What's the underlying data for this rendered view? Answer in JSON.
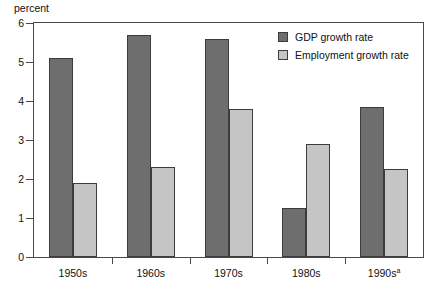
{
  "chart_data": {
    "type": "bar",
    "title": "",
    "xlabel": "",
    "ylabel": "percent",
    "ylim": [
      0,
      6
    ],
    "ytick_labels": [
      "0",
      "1",
      "2",
      "3",
      "4",
      "5",
      "6"
    ],
    "yticks": [
      0,
      1,
      2,
      3,
      4,
      5,
      6
    ],
    "grid": false,
    "legend_position": "top-right inside plot",
    "categories": [
      "1950s",
      "1960s",
      "1970s",
      "1980s",
      "1990s"
    ],
    "category_labels": [
      {
        "text": "1950s",
        "superscript": ""
      },
      {
        "text": "1960s",
        "superscript": ""
      },
      {
        "text": "1970s",
        "superscript": ""
      },
      {
        "text": "1980s",
        "superscript": ""
      },
      {
        "text": "1990s",
        "superscript": "a"
      }
    ],
    "series": [
      {
        "name": "GDP growth rate",
        "color": "#6e6e6e",
        "values": [
          5.1,
          5.7,
          5.6,
          1.25,
          3.85
        ]
      },
      {
        "name": "Employment growth rate",
        "color": "#c5c5c5",
        "values": [
          1.9,
          2.3,
          3.8,
          2.9,
          2.25
        ]
      }
    ]
  },
  "legend": {
    "items": [
      {
        "label": "GDP growth rate",
        "color": "#6e6e6e"
      },
      {
        "label": "Employment growth rate",
        "color": "#c5c5c5"
      }
    ]
  },
  "axes": {
    "y_unit_label": "percent"
  },
  "colors": {
    "series_dark": "#6e6e6e",
    "series_light": "#c5c5c5",
    "frame": "#4a4a4a",
    "bar_outline": "#3c3c3c",
    "background": "#ffffff",
    "text": "#111111"
  }
}
